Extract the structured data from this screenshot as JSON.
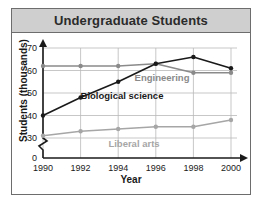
{
  "figure": {
    "title": "Undergraduate Students"
  },
  "chart_data": {
    "type": "line",
    "title": "Undergraduate Students",
    "xlabel": "Year",
    "ylabel": "Students (thousands)",
    "x": [
      1990,
      1992,
      1994,
      1996,
      1998,
      2000
    ],
    "xticklabels": [
      "1990",
      "1992",
      "1994",
      "1996",
      "1998",
      "2000"
    ],
    "yticks": [
      0,
      30,
      40,
      50,
      60,
      70
    ],
    "yticklabels": [
      "0",
      "30",
      "40",
      "50",
      "60",
      "70"
    ],
    "ylim": [
      30,
      70
    ],
    "axis_break": true,
    "grid": true,
    "legend": "inline-labels",
    "series": [
      {
        "name": "Engineering",
        "color": "#8a8a8a",
        "label_color": "#8a8a8a",
        "values": [
          62,
          62,
          62,
          63,
          59,
          59
        ]
      },
      {
        "name": "Biological science",
        "color": "#1a1a1a",
        "label_color": "#1a1a1a",
        "values": [
          40,
          48,
          55,
          63,
          66,
          61
        ]
      },
      {
        "name": "Liberal arts",
        "color": "#a6a6a6",
        "label_color": "#a6a6a6",
        "values": [
          31,
          33,
          34,
          35,
          35,
          38
        ]
      }
    ]
  }
}
